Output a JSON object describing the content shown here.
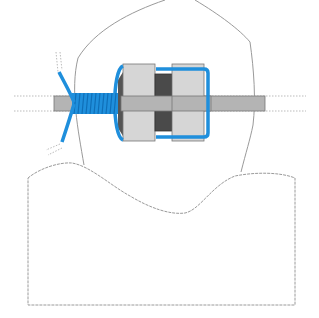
{
  "diagram": {
    "title": "",
    "labels": [],
    "colors": {
      "outline": "#9a9a9a",
      "rod_fill": "#b4b4b4",
      "nut_fill": "#d6d6d6",
      "spacer_fill": "#4a4a4a",
      "wire": "#1f8fdc",
      "wire_dark": "#0f6fb8",
      "background": "#ffffff"
    },
    "parts": [
      "dome-outline",
      "base-block",
      "threaded-rod",
      "nut-left",
      "spacer",
      "nut-right",
      "wire-bracket",
      "wire-coil",
      "wire-lead"
    ]
  }
}
